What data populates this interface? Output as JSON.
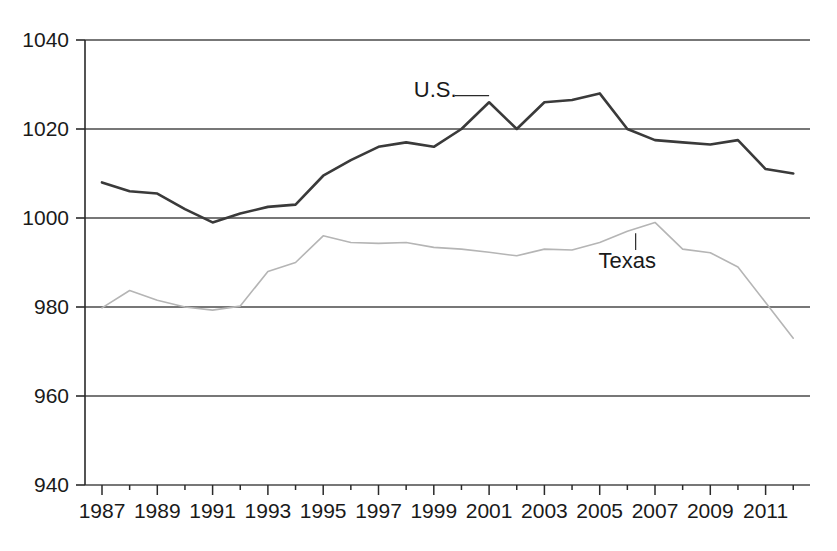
{
  "chart_data": {
    "type": "line",
    "title": "",
    "subtitle": "",
    "xlabel": "",
    "ylabel": "",
    "xlim": [
      1987,
      2012
    ],
    "ylim": [
      940,
      1040
    ],
    "yticks": [
      940,
      960,
      980,
      1000,
      1020,
      1040
    ],
    "ytick_labels": [
      "940",
      "960",
      "980",
      "1000",
      "1020",
      "1040"
    ],
    "xticks": [
      1987,
      1989,
      1991,
      1993,
      1995,
      1997,
      1999,
      2001,
      2003,
      2005,
      2007,
      2009,
      2011
    ],
    "xtick_labels": [
      "1987",
      "1989",
      "1991",
      "1993",
      "1995",
      "1997",
      "1999",
      "2001",
      "2003",
      "2005",
      "2007",
      "2009",
      "2011"
    ],
    "minor_xticks_every": 1,
    "grid": "horizontal",
    "legend_position": "inline-annotations",
    "x": [
      1987,
      1988,
      1989,
      1990,
      1991,
      1992,
      1993,
      1994,
      1995,
      1996,
      1997,
      1998,
      1999,
      2000,
      2001,
      2002,
      2003,
      2004,
      2005,
      2006,
      2007,
      2008,
      2009,
      2010,
      2011,
      2012
    ],
    "series": [
      {
        "name": "U.S.",
        "color": "#3a3a3a",
        "width": 2.6,
        "values": [
          1008,
          1006,
          1005.5,
          1002,
          999,
          1001,
          1002.5,
          1003,
          1009.5,
          1013,
          1016,
          1017,
          1016,
          1020,
          1026,
          1020,
          1026,
          1026.5,
          1028,
          1020,
          1017.5,
          1017,
          1016.5,
          1017.5,
          1011,
          1010
        ]
      },
      {
        "name": "Texas",
        "color": "#b5b5b5",
        "width": 1.6,
        "values": [
          979.8,
          983.7,
          981.5,
          980,
          979.3,
          980.2,
          988,
          990,
          996,
          994.5,
          994.3,
          994.5,
          993.4,
          993,
          992.3,
          991.5,
          993,
          992.8,
          994.5,
          997,
          999,
          993,
          992.2,
          989,
          981,
          973
        ]
      }
    ],
    "annotations": [
      {
        "name": "U.S.",
        "label": "U.S.",
        "label_x": 1999.05,
        "label_y": 1029,
        "leader": {
          "type": "horizontal",
          "from_x": 1999.75,
          "to_x": 2001.0,
          "y": 1027.5
        }
      },
      {
        "name": "Texas",
        "label": "Texas",
        "label_x": 2006.0,
        "label_y": 990.5,
        "leader": {
          "type": "vertical",
          "x": 2006.3,
          "from_y": 992.8,
          "to_y": 996.6
        }
      }
    ]
  },
  "axis": {
    "axis_color": "#2a2a2a",
    "grid_color": "#4a4a4a",
    "background": "#ffffff"
  }
}
